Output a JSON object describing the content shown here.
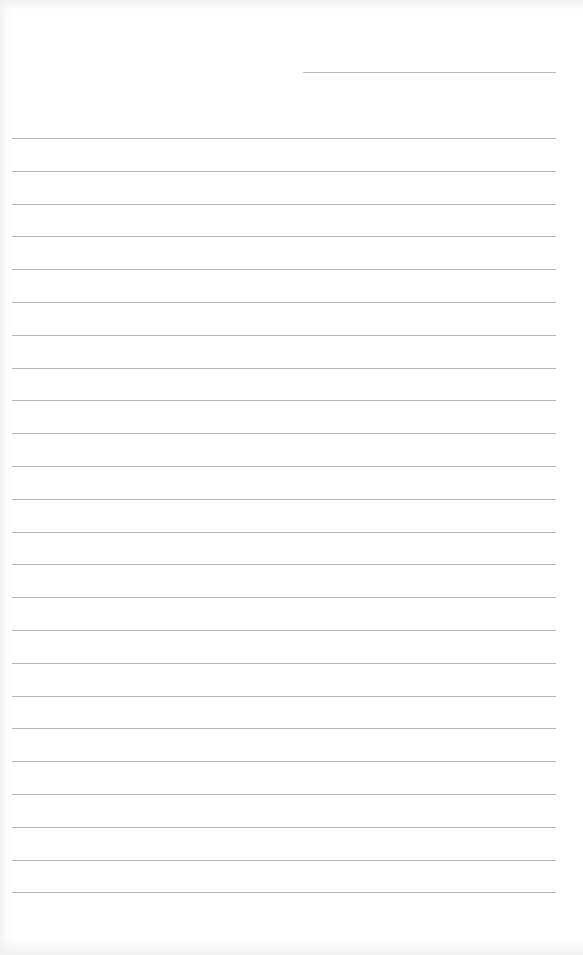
{
  "document": {
    "type": "lined-paper",
    "background_color": "#ffffff",
    "line_color": "#b4b4b4",
    "header_line": {
      "x1": 303,
      "x2": 556,
      "y": 72
    },
    "ruled_lines": {
      "count": 24,
      "x1": 12,
      "x2": 556,
      "first_y": 138,
      "spacing": 32.8
    }
  }
}
